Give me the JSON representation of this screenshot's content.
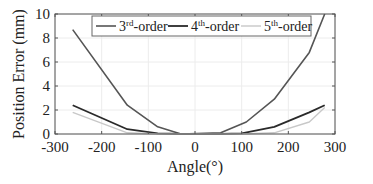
{
  "chart_data": {
    "type": "line",
    "title": "",
    "xlabel": "Angle(°)",
    "ylabel": "Position Error (mm)",
    "xlim": [
      -300,
      300
    ],
    "ylim": [
      0,
      10
    ],
    "xticks": [
      -300,
      -200,
      -100,
      0,
      100,
      200,
      300
    ],
    "yticks": [
      0,
      2,
      4,
      6,
      8,
      10
    ],
    "grid": true,
    "legend_position": "top-inside",
    "series": [
      {
        "name": "3rd-order",
        "label_base": "3",
        "label_sup": "rd",
        "label_suffix": "-order",
        "color": "#555555",
        "width": 1.6,
        "x": [
          -262,
          -145,
          -80,
          -30,
          55,
          110,
          170,
          245,
          278
        ],
        "y": [
          8.7,
          2.4,
          0.6,
          0.0,
          0.1,
          1.0,
          2.9,
          6.8,
          10.0
        ]
      },
      {
        "name": "4th-order",
        "label_base": "4",
        "label_sup": "th",
        "label_suffix": "-order",
        "color": "#2a2a2a",
        "width": 1.8,
        "x": [
          -262,
          -145,
          -80,
          -30,
          55,
          100,
          170,
          245,
          278
        ],
        "y": [
          2.4,
          0.4,
          0.05,
          0.0,
          0.0,
          0.05,
          0.6,
          1.8,
          2.4
        ]
      },
      {
        "name": "5th-order",
        "label_base": "5",
        "label_sup": "th",
        "label_suffix": "-order",
        "color": "#c8c8c8",
        "width": 1.4,
        "x": [
          -262,
          -145,
          -80,
          100,
          170,
          245,
          278
        ],
        "y": [
          1.8,
          0.1,
          0.0,
          0.0,
          0.1,
          1.0,
          2.2
        ]
      }
    ]
  }
}
